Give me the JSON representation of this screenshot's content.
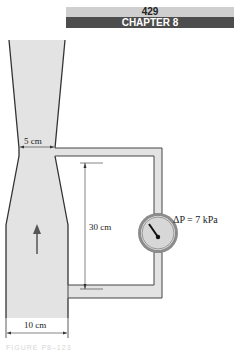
{
  "header": {
    "page_number": "429",
    "chapter": "CHAPTER 8"
  },
  "diagram": {
    "throat_diameter_label": "5 cm",
    "inlet_diameter_label": "10 cm",
    "tap_separation_label": "30 cm",
    "pressure_diff_label": "ΔP = 7 kPa",
    "flow_direction": "upward",
    "colors": {
      "fluid_fill": "#e3e3e3",
      "wall": "#333333",
      "gauge_ring": "#6a6a6a"
    }
  },
  "caption": "FIGURE P8–123"
}
